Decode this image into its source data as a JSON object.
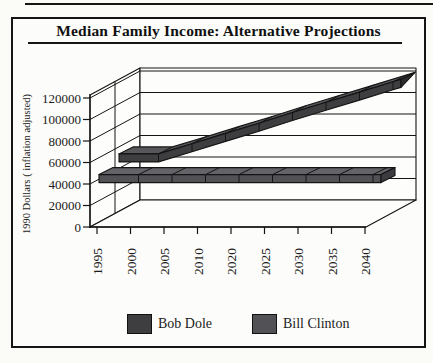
{
  "page": {
    "top_rule": "rule"
  },
  "header": {
    "title": "Median Family Income: Alternative Projections"
  },
  "chart": {
    "y_axis_title": "1990 Dollars ( inflation adjusted)",
    "legend": [
      {
        "label": "Bob Dole",
        "color": "#3e3e40",
        "color_top": "#56565b",
        "color_dark": "#2d2d2f"
      },
      {
        "label": "Bill Clinton",
        "color": "#515156",
        "color_top": "#636368",
        "color_dark": "#3c3c40"
      }
    ]
  },
  "chart_data": {
    "type": "line",
    "variant": "3d-ribbon",
    "title": "Median Family Income: Alternative Projections",
    "ylabel": "1990 Dollars ( inflation adjusted)",
    "xlabel": "",
    "categories": [
      "1995",
      "2000",
      "2005",
      "2010",
      "2020",
      "2025",
      "2030",
      "2035",
      "2040"
    ],
    "series": [
      {
        "name": "Bob Dole",
        "values": [
          55000,
          55000,
          64500,
          74000,
          83500,
          93500,
          103000,
          112500,
          122000
        ]
      },
      {
        "name": "Bill Clinton",
        "values": [
          45000,
          45000,
          45000,
          45000,
          45000,
          45000,
          45000,
          45000,
          45000
        ]
      }
    ],
    "ylim": [
      0,
      120000
    ],
    "yticks": [
      0,
      20000,
      40000,
      60000,
      80000,
      100000,
      120000
    ],
    "grid": true,
    "legend_position": "bottom"
  }
}
